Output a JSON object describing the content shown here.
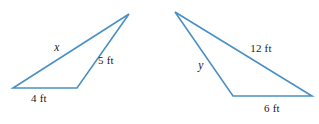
{
  "figure": {
    "kind": "geometry-diagram",
    "background_color": "#ffffff",
    "stroke_color": "#4a90c4",
    "stroke_width": 1.6,
    "text_color": "#1a1a1a",
    "width": 319,
    "height": 124
  },
  "shapes": [
    {
      "name": "left-triangle",
      "vertices": [
        {
          "name": "bottom-left",
          "x": 13,
          "y": 88
        },
        {
          "name": "bottom-right",
          "x": 77,
          "y": 88
        },
        {
          "name": "apex",
          "x": 129,
          "y": 14
        }
      ],
      "path": "M 13 88 L 77 88 L 129 14 Z"
    },
    {
      "name": "right-triangle",
      "vertices": [
        {
          "name": "apex",
          "x": 175,
          "y": 12
        },
        {
          "name": "bottom-left",
          "x": 233,
          "y": 96
        },
        {
          "name": "bottom-right",
          "x": 312,
          "y": 96
        }
      ],
      "path": "M 175 12 L 233 96 L 312 96 Z"
    }
  ],
  "labels": [
    {
      "id": "left-unknown-side",
      "text": "x",
      "italic": true,
      "x": 57,
      "y": 48,
      "shape": "left-triangle",
      "side": "bottom-left-to-apex"
    },
    {
      "id": "left-side-5ft",
      "text": "5 ft",
      "italic": false,
      "x": 106,
      "y": 60,
      "shape": "left-triangle",
      "side": "bottom-right-to-apex"
    },
    {
      "id": "left-base-4ft",
      "text": "4 ft",
      "italic": false,
      "x": 39,
      "y": 98,
      "shape": "left-triangle",
      "side": "base"
    },
    {
      "id": "right-side-12ft",
      "text": "12 ft",
      "italic": false,
      "x": 261,
      "y": 48,
      "shape": "right-triangle",
      "side": "apex-to-bottom-right"
    },
    {
      "id": "right-unknown-side",
      "text": "y",
      "italic": true,
      "x": 201,
      "y": 66,
      "shape": "right-triangle",
      "side": "apex-to-bottom-left"
    },
    {
      "id": "right-base-6ft",
      "text": "6 ft",
      "italic": false,
      "x": 272,
      "y": 108,
      "shape": "right-triangle",
      "side": "base"
    }
  ]
}
